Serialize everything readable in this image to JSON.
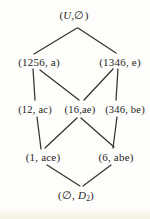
{
  "diagram": {
    "type": "hasse-lattice-diagram",
    "ink_color": "#35322d",
    "background_color": "#fdfdfb",
    "top_node": {
      "open": "(",
      "var": "U",
      "close": ",∅)"
    },
    "bottom_node": {
      "open": "(∅, ",
      "var": "D",
      "sub": "2",
      "close": ")"
    },
    "nodes": {
      "n1256a": {
        "text": "(1256, a)"
      },
      "n1346e": {
        "text": "(1346, e)"
      },
      "n12ac": {
        "text": "(12, ac)"
      },
      "n16ae": {
        "text": "(16,ae)"
      },
      "n346be": {
        "text": "(346, be)"
      },
      "n1ace": {
        "text": "(1, ace)"
      },
      "n6abe": {
        "text": "(6, abe)"
      }
    },
    "edges": [
      {
        "from": "(U,∅)",
        "to": "(1256, a)"
      },
      {
        "from": "(U,∅)",
        "to": "(1346, e)"
      },
      {
        "from": "(1256, a)",
        "to": "(12, ac)"
      },
      {
        "from": "(1256, a)",
        "to": "(16,ae)"
      },
      {
        "from": "(1346, e)",
        "to": "(16,ae)"
      },
      {
        "from": "(1346, e)",
        "to": "(346, be)"
      },
      {
        "from": "(12, ac)",
        "to": "(1, ace)"
      },
      {
        "from": "(16,ae)",
        "to": "(1, ace)"
      },
      {
        "from": "(16,ae)",
        "to": "(6, abe)"
      },
      {
        "from": "(346, be)",
        "to": "(6, abe)"
      },
      {
        "from": "(1, ace)",
        "to": "(∅, D₂)"
      },
      {
        "from": "(6, abe)",
        "to": "(∅, D₂)"
      }
    ]
  }
}
